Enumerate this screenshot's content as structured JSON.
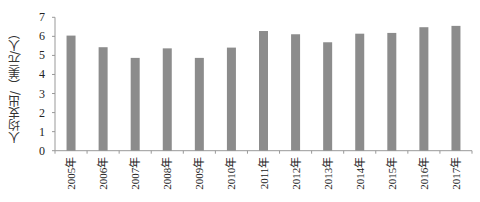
{
  "chart_data": {
    "type": "bar",
    "title": "",
    "xlabel": "",
    "ylabel": "人均支出/（美元/人）",
    "categories": [
      "2005年",
      "2006年",
      "2007年",
      "2008年",
      "2009年",
      "2010年",
      "2011年",
      "2012年",
      "2013年",
      "2014年",
      "2015年",
      "2016年",
      "2017年"
    ],
    "values": [
      6.04,
      5.43,
      4.87,
      5.37,
      4.87,
      5.41,
      6.28,
      6.11,
      5.69,
      6.14,
      6.18,
      6.48,
      6.55
    ],
    "yticks": [
      0,
      1,
      2,
      3,
      4,
      5,
      6,
      7
    ],
    "ylim": [
      0,
      7
    ],
    "grid": false,
    "legend": null,
    "bar_color": "#8c8c8c"
  }
}
